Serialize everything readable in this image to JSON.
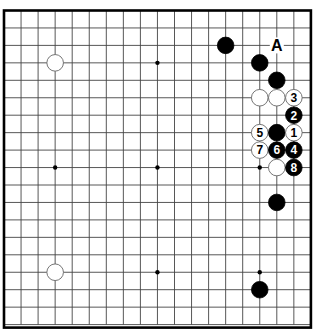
{
  "diagram": {
    "type": "go-board",
    "size": 19,
    "label_A": "A",
    "hoshi": [
      [
        3,
        3
      ],
      [
        9,
        3
      ],
      [
        15,
        3
      ],
      [
        3,
        9
      ],
      [
        9,
        9
      ],
      [
        15,
        9
      ],
      [
        3,
        15
      ],
      [
        9,
        15
      ],
      [
        15,
        15
      ]
    ],
    "stones": [
      {
        "col": 3,
        "row": 3,
        "color": "white",
        "label": ""
      },
      {
        "col": 3,
        "row": 15,
        "color": "white",
        "label": ""
      },
      {
        "col": 13,
        "row": 2,
        "color": "black",
        "label": ""
      },
      {
        "col": 15,
        "row": 3,
        "color": "black",
        "label": ""
      },
      {
        "col": 16,
        "row": 4,
        "color": "black",
        "label": ""
      },
      {
        "col": 15,
        "row": 5,
        "color": "white",
        "label": ""
      },
      {
        "col": 16,
        "row": 5,
        "color": "white",
        "label": ""
      },
      {
        "col": 17,
        "row": 5,
        "color": "white",
        "label": "3"
      },
      {
        "col": 17,
        "row": 6,
        "color": "black",
        "label": "2"
      },
      {
        "col": 15,
        "row": 7,
        "color": "white",
        "label": "5"
      },
      {
        "col": 16,
        "row": 7,
        "color": "black",
        "label": ""
      },
      {
        "col": 17,
        "row": 7,
        "color": "white",
        "label": "1"
      },
      {
        "col": 15,
        "row": 8,
        "color": "white",
        "label": "7"
      },
      {
        "col": 16,
        "row": 8,
        "color": "black",
        "label": "6"
      },
      {
        "col": 17,
        "row": 8,
        "color": "black",
        "label": "4"
      },
      {
        "col": 16,
        "row": 9,
        "color": "white",
        "label": ""
      },
      {
        "col": 17,
        "row": 9,
        "color": "black",
        "label": "8"
      },
      {
        "col": 16,
        "row": 11,
        "color": "black",
        "label": ""
      },
      {
        "col": 15,
        "row": 16,
        "color": "black",
        "label": ""
      }
    ],
    "markers": [
      {
        "col": 16,
        "row": 2,
        "text": "A"
      }
    ]
  }
}
